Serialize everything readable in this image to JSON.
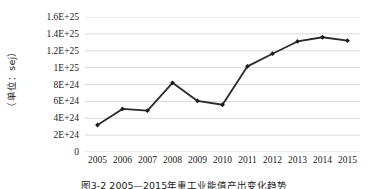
{
  "chart_data": {
    "type": "line",
    "title": "",
    "xlabel": "",
    "ylabel": "（单位：sej）",
    "categories": [
      "2005",
      "2006",
      "2007",
      "2008",
      "2009",
      "2010",
      "2011",
      "2012",
      "2013",
      "2014",
      "2015"
    ],
    "values": [
      3.2e+24,
      5.1e+24,
      4.9e+24,
      8.2e+24,
      6.05e+24,
      5.6e+24,
      1.015e+25,
      1.165e+25,
      1.31e+25,
      1.36e+25,
      1.32e+25
    ],
    "series": [
      {
        "name": "",
        "values": [
          3.2e+24,
          5.1e+24,
          4.9e+24,
          8.2e+24,
          6.05e+24,
          5.6e+24,
          1.015e+25,
          1.165e+25,
          1.31e+25,
          1.36e+25,
          1.32e+25
        ]
      }
    ],
    "ylim": [
      0,
      1.6e+25
    ],
    "ytick_values": [
      0,
      2e+24,
      4e+24,
      6e+24,
      8e+24,
      1e+25,
      1.2e+25,
      1.4e+25,
      1.6e+25
    ],
    "ytick_labels": [
      "0",
      "2E+24",
      "4E+24",
      "6E+24",
      "8E+24",
      "1E+25",
      "1.2E+25",
      "1.4E+25",
      "1.6E+25"
    ],
    "grid": true,
    "grid_axis": "y",
    "legend": false,
    "legend_position": "none",
    "marker": "diamond",
    "line_color": "#2b2b2b",
    "marker_color": "#1c1c1c",
    "grid_color": "#d9d9d9",
    "background_color": "#ffffff"
  },
  "caption": {
    "text": "图3-2 2005—2015年重工业能值产出变化趋势"
  }
}
